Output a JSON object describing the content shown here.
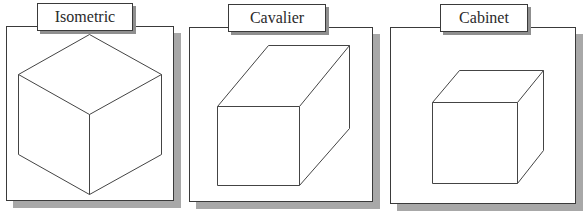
{
  "diagram": {
    "title": "",
    "colors": {
      "border": "#3a3a3a",
      "shadow": "#a8a8a8",
      "line": "#444444",
      "background": "#ffffff"
    },
    "panels": [
      {
        "id": "isometric",
        "label": "Isometric",
        "projection": "isometric cube",
        "frame": {
          "x": 6,
          "y": 26,
          "w": 168,
          "h": 175
        },
        "label_box": {
          "x": 37,
          "y": 3,
          "w": 96,
          "h": 28
        },
        "edges": [
          [
            [
              89,
              34
            ],
            [
              18,
              74
            ]
          ],
          [
            [
              89,
              34
            ],
            [
              161,
              74
            ]
          ],
          [
            [
              18,
              74
            ],
            [
              89,
              114
            ]
          ],
          [
            [
              161,
              74
            ],
            [
              89,
              114
            ]
          ],
          [
            [
              18,
              74
            ],
            [
              18,
              154
            ]
          ],
          [
            [
              161,
              74
            ],
            [
              161,
              154
            ]
          ],
          [
            [
              89,
              114
            ],
            [
              89,
              194
            ]
          ],
          [
            [
              18,
              154
            ],
            [
              89,
              194
            ]
          ],
          [
            [
              161,
              154
            ],
            [
              89,
              194
            ]
          ]
        ]
      },
      {
        "id": "cavalier",
        "label": "Cavalier",
        "projection": "cavalier oblique box",
        "frame": {
          "x": 189,
          "y": 27,
          "w": 184,
          "h": 175
        },
        "label_box": {
          "x": 228,
          "y": 4,
          "w": 98,
          "h": 28
        },
        "edges": [
          [
            [
              217,
              106
            ],
            [
              299,
              106
            ]
          ],
          [
            [
              299,
              106
            ],
            [
              299,
              185
            ]
          ],
          [
            [
              299,
              185
            ],
            [
              217,
              185
            ]
          ],
          [
            [
              217,
              185
            ],
            [
              217,
              106
            ]
          ],
          [
            [
              217,
              106
            ],
            [
              268,
              45
            ]
          ],
          [
            [
              268,
              45
            ],
            [
              349,
              45
            ]
          ],
          [
            [
              299,
              106
            ],
            [
              349,
              45
            ]
          ],
          [
            [
              349,
              45
            ],
            [
              349,
              128
            ]
          ],
          [
            [
              299,
              185
            ],
            [
              349,
              128
            ]
          ]
        ]
      },
      {
        "id": "cabinet",
        "label": "Cabinet",
        "projection": "cabinet oblique box",
        "frame": {
          "x": 390,
          "y": 27,
          "w": 186,
          "h": 177
        },
        "label_box": {
          "x": 440,
          "y": 4,
          "w": 88,
          "h": 28
        },
        "edges": [
          [
            [
              432,
              102
            ],
            [
              517,
              102
            ]
          ],
          [
            [
              517,
              102
            ],
            [
              517,
              183
            ]
          ],
          [
            [
              517,
              183
            ],
            [
              432,
              183
            ]
          ],
          [
            [
              432,
              183
            ],
            [
              432,
              102
            ]
          ],
          [
            [
              432,
              102
            ],
            [
              459,
              70
            ]
          ],
          [
            [
              459,
              70
            ],
            [
              543,
              70
            ]
          ],
          [
            [
              517,
              102
            ],
            [
              543,
              70
            ]
          ],
          [
            [
              543,
              70
            ],
            [
              543,
              150
            ]
          ],
          [
            [
              517,
              183
            ],
            [
              543,
              150
            ]
          ]
        ]
      }
    ]
  }
}
